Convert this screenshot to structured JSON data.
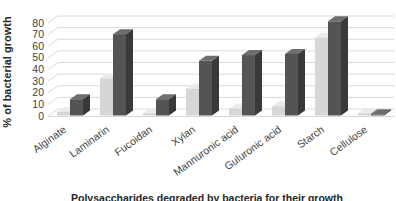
{
  "chart_data": {
    "type": "bar",
    "subtype": "3d-clustered-column",
    "title": "",
    "xlabel": "Polysaccharides degraded by bacteria for their growth",
    "ylabel": "% of bacterial growth",
    "categories": [
      "Alginate",
      "Laminarin",
      "Fucoidan",
      "Xylan",
      "Mannuronic acid",
      "Guluronic acid",
      "Starch",
      "Cellulose"
    ],
    "series": [
      {
        "name": "light",
        "color": "#d6d6d6",
        "values": [
          3,
          32,
          2,
          23,
          6,
          8,
          67,
          2
        ]
      },
      {
        "name": "dark",
        "color": "#545454",
        "values": [
          14,
          70,
          14,
          47,
          52,
          53,
          81,
          1
        ]
      }
    ],
    "y_ticks": [
      0,
      10,
      20,
      30,
      40,
      50,
      60,
      70,
      80
    ],
    "ylim": [
      0,
      80
    ],
    "grid": true,
    "legend": false,
    "colors": {
      "gridline": "#d9d9d9",
      "tick_text": "#3f3f3f",
      "light_face": "#d6d6d6",
      "light_top": "#ebebeb",
      "light_side": "#a8a8a8",
      "dark_face": "#545454",
      "dark_top": "#6e6e6e",
      "dark_side": "#393939",
      "background": "#ffffff"
    }
  }
}
